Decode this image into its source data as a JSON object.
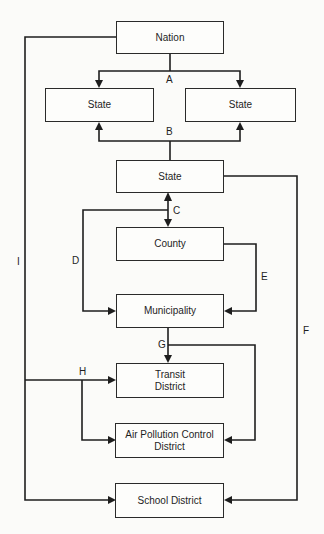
{
  "diagram": {
    "type": "intergovernmental-relations-flow",
    "nodes": {
      "nation": "Nation",
      "state_left": "State",
      "state_right": "State",
      "state_center": "State",
      "county": "County",
      "municipality": "Municipality",
      "transit_line1": "Transit",
      "transit_line2": "District",
      "air_line1": "Air Pollution Control",
      "air_line2": "District",
      "school": "School District"
    },
    "edge_labels": {
      "a": "A",
      "b": "B",
      "c": "C",
      "d": "D",
      "e": "E",
      "f": "F",
      "g": "G",
      "h": "H",
      "i": "I"
    },
    "edges": [
      {
        "label": "A",
        "from": "Nation",
        "to": [
          "State (left)",
          "State (right)"
        ]
      },
      {
        "label": "B",
        "from": "State (center)",
        "to": [
          "State (left)",
          "State (right)"
        ]
      },
      {
        "label": "C",
        "from": "State (center)",
        "to": "County",
        "bidirectional": true
      },
      {
        "label": "D",
        "from": "State (center)",
        "to": "Municipality"
      },
      {
        "label": "E",
        "from": "County",
        "to": "Municipality"
      },
      {
        "label": "F",
        "from": "State (center)",
        "to": "School District"
      },
      {
        "label": "G",
        "from": "Municipality",
        "to": [
          "Transit District",
          "Air Pollution Control District"
        ]
      },
      {
        "label": "H",
        "from": "Nation (via I)",
        "to": [
          "Transit District",
          "Air Pollution Control District"
        ]
      },
      {
        "label": "I",
        "from": "Nation",
        "to": "School District"
      }
    ]
  }
}
